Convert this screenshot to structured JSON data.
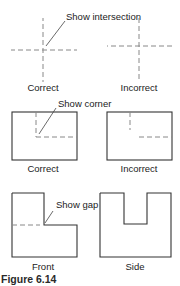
{
  "figure": {
    "caption": "Figure 6.14",
    "rows": [
      {
        "left": {
          "label": "Correct",
          "note": "Show intersection"
        },
        "right": {
          "label": "Incorrect"
        }
      },
      {
        "left": {
          "label": "Correct",
          "note": "Show corner"
        },
        "right": {
          "label": "Incorrect"
        }
      },
      {
        "left": {
          "label": "Front",
          "note": "Show gap"
        },
        "right": {
          "label": "Side"
        }
      }
    ]
  },
  "colors": {
    "object_line": "#333333",
    "hidden_line": "#888888",
    "text": "#222222"
  }
}
